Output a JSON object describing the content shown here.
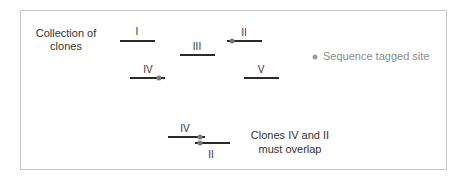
{
  "title": {
    "line1": "Collection of",
    "line2": "clones"
  },
  "clones": [
    {
      "label": "I",
      "has_sts": false
    },
    {
      "label": "II",
      "has_sts": true
    },
    {
      "label": "III",
      "has_sts": false
    },
    {
      "label": "IV",
      "has_sts": true
    },
    {
      "label": "V",
      "has_sts": false
    }
  ],
  "legend": {
    "icon": "dot-icon",
    "label": "Sequence tagged site",
    "color": "#9a9a9a"
  },
  "overlap": {
    "clone_top_label": "IV",
    "clone_bottom_label": "II",
    "caption_line1": "Clones IV and II",
    "caption_line2": "must overlap"
  },
  "colors": {
    "line": "#2a2a2a",
    "sts_dot": "#7a7a7a",
    "border": "#c8c8c8"
  }
}
